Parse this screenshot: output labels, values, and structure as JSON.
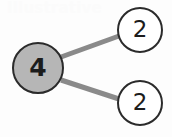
{
  "diagram": {
    "type": "number-bond",
    "background_color": "#fdfdfd",
    "watermark_text": "Illustrative",
    "watermark_color": "#fbfbfb",
    "edge_color": "#8a8a8a",
    "edge_width": 5,
    "nodes": [
      {
        "id": "root",
        "label": "4",
        "role": "whole",
        "shape": "circle",
        "fill": "#b6b6b6",
        "stroke": "#2b2b2b",
        "cx": 38,
        "cy": 68,
        "r": 26
      },
      {
        "id": "part-top",
        "label": "2",
        "role": "part",
        "shape": "circle",
        "fill": "#ffffff",
        "stroke": "#2b2b2b",
        "cx": 140,
        "cy": 30,
        "r": 23
      },
      {
        "id": "part-bottom",
        "label": "2",
        "role": "part",
        "shape": "circle",
        "fill": "#ffffff",
        "stroke": "#2b2b2b",
        "cx": 140,
        "cy": 103,
        "r": 23
      }
    ],
    "edges": [
      {
        "id": "edge-root-top",
        "from": "root",
        "to": "part-top",
        "x1": 61,
        "y1": 57,
        "x2": 119,
        "y2": 36
      },
      {
        "id": "edge-root-bottom",
        "from": "root",
        "to": "part-bottom",
        "x1": 61,
        "y1": 80,
        "x2": 119,
        "y2": 99
      }
    ]
  }
}
